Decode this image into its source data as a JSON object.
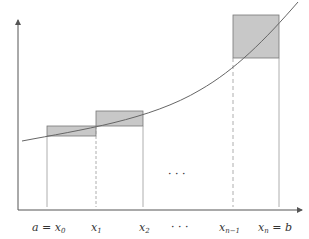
{
  "diagram": {
    "title": "",
    "type": "riemann-sum-upper",
    "colors": {
      "axis": "#555555",
      "curve": "#666666",
      "rect_fill": "#c8c8c8",
      "rect_stroke": "#777777",
      "guide": "#888888"
    },
    "labels": {
      "x0": {
        "main": "a = x",
        "sub": "0"
      },
      "x1": {
        "main": "x",
        "sub": "1"
      },
      "x2": {
        "main": "x",
        "sub": "2"
      },
      "dots_axis": "· · ·",
      "xn1": {
        "main": "x",
        "sub": "n−1"
      },
      "xn": {
        "main": "x",
        "sub": "n",
        "suffix": " = b"
      },
      "dots_mid": "· · ·"
    },
    "partition_points": [
      "a = x0",
      "x1",
      "x2",
      "...",
      "x(n-1)",
      "xn = b"
    ],
    "rectangles": [
      {
        "from": "x0",
        "to": "x1",
        "shaded": "upper-sum excess"
      },
      {
        "from": "x1",
        "to": "x2",
        "shaded": "upper-sum excess"
      },
      {
        "from": "x(n-1)",
        "to": "xn",
        "shaded": "upper-sum excess"
      }
    ]
  }
}
